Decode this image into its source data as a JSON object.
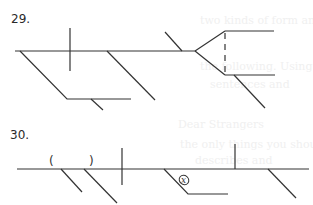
{
  "problems": [
    {
      "number_label": "29.",
      "type": "sentence-diagram",
      "elements": {
        "baseline": true,
        "subject_verb_divider": true,
        "compound_fork": true,
        "dashed_connector": true
      }
    },
    {
      "number_label": "30.",
      "type": "sentence-diagram",
      "annotations": {
        "parentheses_open": "(",
        "parentheses_close": ")",
        "circled_marker": "x"
      }
    }
  ],
  "bleed_through_text": [
    "two kinds of form and",
    "the following. Using",
    "sentences and",
    "Dear Strangers",
    "the only things you should",
    "describes and"
  ],
  "colors": {
    "line": "#333333",
    "background": "#ffffff",
    "ghost_text": "#f0f0f0"
  }
}
